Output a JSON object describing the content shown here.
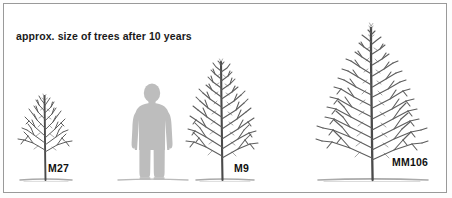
{
  "figure": {
    "caption": "approx. size of trees after 10 years",
    "frame": {
      "border_color": "#9a9a9a",
      "background": "#ffffff"
    },
    "palette": {
      "branch": "#5d5d5d",
      "trunk": "#4a4a4a",
      "ground": "#8d8d8d",
      "silhouette": "#bdbdbd",
      "text": "#111111"
    },
    "human_reference": {
      "name": "human-silhouette",
      "label": "",
      "description": "grey standing person silhouette for scale"
    },
    "trees": [
      {
        "label": "M27",
        "rootstock": "M27",
        "relative_size": "smallest",
        "canopy_top_y": 95,
        "ground_y": 180,
        "center_x": 45
      },
      {
        "label": "M9",
        "rootstock": "M9",
        "relative_size": "medium",
        "canopy_top_y": 58,
        "ground_y": 180,
        "center_x": 222
      },
      {
        "label": "MM106",
        "rootstock": "MM106",
        "relative_size": "largest",
        "canopy_top_y": 24,
        "ground_y": 180,
        "center_x": 372
      }
    ]
  }
}
